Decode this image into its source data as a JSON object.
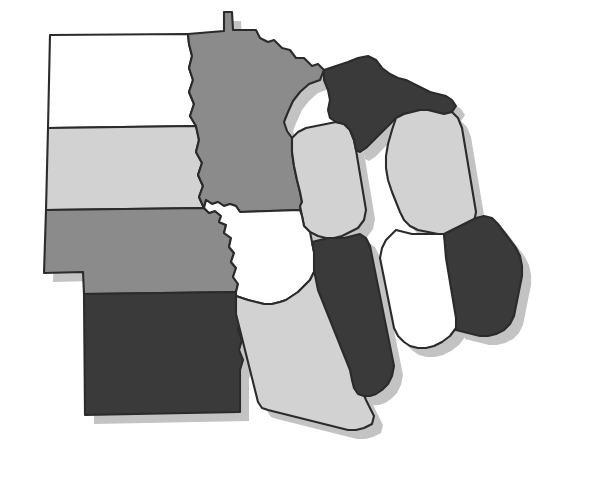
{
  "figure": {
    "type": "choropleth-map",
    "region": "United States Midwest",
    "background_color": "#ffffff",
    "outline_color": "#2b2b2b",
    "shadow_color": "#c3c3c3",
    "shadow_offset": {
      "x": 9,
      "y": 9
    }
  },
  "legend": {
    "visible": false,
    "shade_levels": [
      {
        "key": "white",
        "color": "#ffffff",
        "rank": 1
      },
      {
        "key": "light-gray",
        "color": "#d2d2d2",
        "rank": 2
      },
      {
        "key": "medium-gray",
        "color": "#8b8b8b",
        "rank": 3
      },
      {
        "key": "dark-gray",
        "color": "#3a3a3a",
        "rank": 4
      }
    ]
  },
  "chart_data": {
    "type": "heatmap",
    "title": "",
    "xlabel": "",
    "ylabel": "",
    "legend_position": "none",
    "grid": false,
    "categories": [
      "North Dakota",
      "South Dakota",
      "Nebraska",
      "Kansas",
      "Minnesota",
      "Iowa",
      "Missouri",
      "Wisconsin",
      "Illinois",
      "Michigan",
      "Indiana",
      "Ohio"
    ],
    "values": [
      1,
      2,
      3,
      4,
      3,
      1,
      2,
      2,
      4,
      2,
      1,
      4
    ],
    "value_labels": [
      "white",
      "light-gray",
      "medium-gray",
      "dark-gray",
      "medium-gray",
      "white",
      "light-gray",
      "light-gray",
      "dark-gray",
      "light-gray",
      "white",
      "dark-gray"
    ],
    "colors": [
      "#ffffff",
      "#d2d2d2",
      "#8b8b8b",
      "#3a3a3a",
      "#8b8b8b",
      "#ffffff",
      "#d2d2d2",
      "#d2d2d2",
      "#3a3a3a",
      "#d2d2d2",
      "#ffffff",
      "#3a3a3a"
    ]
  },
  "states": {
    "north_dakota": {
      "name": "North Dakota",
      "abbr": "ND",
      "fill": "#ffffff",
      "shade": "white"
    },
    "south_dakota": {
      "name": "South Dakota",
      "abbr": "SD",
      "fill": "#d2d2d2",
      "shade": "light-gray"
    },
    "nebraska": {
      "name": "Nebraska",
      "abbr": "NE",
      "fill": "#8b8b8b",
      "shade": "medium-gray"
    },
    "kansas": {
      "name": "Kansas",
      "abbr": "KS",
      "fill": "#3a3a3a",
      "shade": "dark-gray"
    },
    "minnesota": {
      "name": "Minnesota",
      "abbr": "MN",
      "fill": "#8b8b8b",
      "shade": "medium-gray"
    },
    "iowa": {
      "name": "Iowa",
      "abbr": "IA",
      "fill": "#ffffff",
      "shade": "white"
    },
    "missouri": {
      "name": "Missouri",
      "abbr": "MO",
      "fill": "#d2d2d2",
      "shade": "light-gray"
    },
    "wisconsin": {
      "name": "Wisconsin",
      "abbr": "WI",
      "fill": "#d2d2d2",
      "shade": "light-gray"
    },
    "illinois": {
      "name": "Illinois",
      "abbr": "IL",
      "fill": "#3a3a3a",
      "shade": "dark-gray"
    },
    "michigan_upper": {
      "name": "Michigan Upper Peninsula",
      "abbr": "MI-UP",
      "fill": "#3a3a3a",
      "shade": "dark-gray"
    },
    "michigan_lower": {
      "name": "Michigan Lower Peninsula",
      "abbr": "MI-LP",
      "fill": "#d2d2d2",
      "shade": "light-gray"
    },
    "indiana": {
      "name": "Indiana",
      "abbr": "IN",
      "fill": "#ffffff",
      "shade": "white"
    },
    "ohio": {
      "name": "Ohio",
      "abbr": "OH",
      "fill": "#3a3a3a",
      "shade": "dark-gray"
    }
  }
}
